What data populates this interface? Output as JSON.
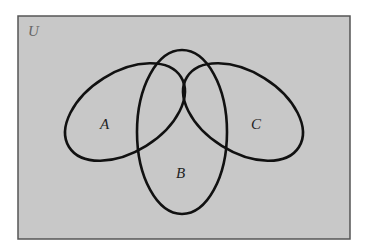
{
  "diagram": {
    "type": "venn",
    "universe": {
      "label": "U",
      "fill": "#c8c8c8",
      "border": "#555555"
    },
    "sets": [
      {
        "name": "A",
        "label": "A"
      },
      {
        "name": "B",
        "label": "B"
      },
      {
        "name": "C",
        "label": "C"
      }
    ],
    "highlighted_region": {
      "description": "A ∩ B ∩ C",
      "fill": "#ffffff"
    },
    "shaded_region": {
      "description": "complement of A ∩ B ∩ C",
      "fill": "#c8c8c8"
    },
    "outline_color": "#111111"
  }
}
